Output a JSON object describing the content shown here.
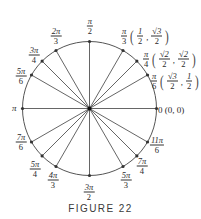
{
  "figure": {
    "caption": "FIGURE 22",
    "center": {
      "x": 89.5,
      "y": 108.5
    },
    "radius": 67,
    "stroke_color": "#555555",
    "origin_label": "0 (0, 0)"
  },
  "angles": [
    {
      "deg": 0,
      "label": "0"
    },
    {
      "deg": 30,
      "num": "π",
      "den": "6"
    },
    {
      "deg": 45,
      "num": "π",
      "den": "4"
    },
    {
      "deg": 60,
      "num": "π",
      "den": "3"
    },
    {
      "deg": 90,
      "num": "π",
      "den": "2"
    },
    {
      "deg": 120,
      "num": "2π",
      "den": "3"
    },
    {
      "deg": 135,
      "num": "3π",
      "den": "4"
    },
    {
      "deg": 150,
      "num": "5π",
      "den": "6"
    },
    {
      "deg": 180,
      "label": "π"
    },
    {
      "deg": 210,
      "num": "7π",
      "den": "6"
    },
    {
      "deg": 225,
      "num": "5π",
      "den": "4"
    },
    {
      "deg": 240,
      "num": "4π",
      "den": "3"
    },
    {
      "deg": 270,
      "num": "3π",
      "den": "2"
    },
    {
      "deg": 300,
      "num": "5π",
      "den": "3"
    },
    {
      "deg": 315,
      "num": "7π",
      "den": "4"
    },
    {
      "deg": 330,
      "num": "11π",
      "den": "6"
    }
  ],
  "coords": {
    "pi_3": {
      "x_num": "1",
      "x_den": "2",
      "y_num": "√3",
      "y_den": "2"
    },
    "pi_4": {
      "x_num": "√2",
      "x_den": "2",
      "y_num": "√2",
      "y_den": "2"
    },
    "pi_6": {
      "x_num": "√3",
      "x_den": "2",
      "y_num": "1",
      "y_den": "2"
    }
  },
  "labels": {
    "pi": "π",
    "zero": "0 (0, 0)",
    "a90": {
      "num": "π",
      "den": "2"
    },
    "a120": {
      "num": "2π",
      "den": "3"
    },
    "a135": {
      "num": "3π",
      "den": "4"
    },
    "a150": {
      "num": "5π",
      "den": "6"
    },
    "a60": {
      "num": "π",
      "den": "3"
    },
    "a45": {
      "num": "π",
      "den": "4"
    },
    "a30": {
      "num": "π",
      "den": "6"
    },
    "a210": {
      "num": "7π",
      "den": "6"
    },
    "a225": {
      "num": "5π",
      "den": "4"
    },
    "a240": {
      "num": "4π",
      "den": "3"
    },
    "a270": {
      "num": "3π",
      "den": "2"
    },
    "a300": {
      "num": "5π",
      "den": "3"
    },
    "a315": {
      "num": "7π",
      "den": "4"
    },
    "a330": {
      "num": "11π",
      "den": "6"
    }
  }
}
